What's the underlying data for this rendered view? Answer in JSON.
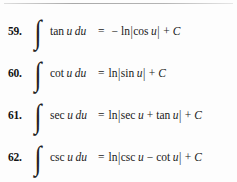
{
  "page": {
    "background_color": "#fdfdfd",
    "text_color": "#1a1a1a",
    "rule_color": "#9a9a9a"
  },
  "formulas": [
    {
      "number": "59.",
      "integral_symbol": "∫",
      "integrand_func": "tan",
      "integrand_var": "u",
      "differential": "du",
      "equals": "=",
      "rhs_sign": "−",
      "rhs_log": "ln",
      "abs_open": "|",
      "rhs_func": "cos",
      "rhs_var": "u",
      "abs_close": "|",
      "plus": "+",
      "constant": "C",
      "full_text": "59. ∫ tan u du = −ln|cos u| + C"
    },
    {
      "number": "60.",
      "integral_symbol": "∫",
      "integrand_func": "cot",
      "integrand_var": "u",
      "differential": "du",
      "equals": "=",
      "rhs_sign": "",
      "rhs_log": "ln",
      "abs_open": "|",
      "rhs_func": "sin",
      "rhs_var": "u",
      "abs_close": "|",
      "plus": "+",
      "constant": "C",
      "full_text": "60. ∫ cot u du = ln|sin u| + C"
    },
    {
      "number": "61.",
      "integral_symbol": "∫",
      "integrand_func": "sec",
      "integrand_var": "u",
      "differential": "du",
      "equals": "=",
      "rhs_sign": "",
      "rhs_log": "ln",
      "abs_open": "|",
      "rhs_func": "sec",
      "rhs_var": "u",
      "inner_op": "+",
      "rhs_func2": "tan",
      "rhs_var2": "u",
      "abs_close": "|",
      "plus": "+",
      "constant": "C",
      "full_text": "61. ∫ sec u du = ln|sec u + tan u| + C"
    },
    {
      "number": "62.",
      "integral_symbol": "∫",
      "integrand_func": "csc",
      "integrand_var": "u",
      "differential": "du",
      "equals": "=",
      "rhs_sign": "",
      "rhs_log": "ln",
      "abs_open": "|",
      "rhs_func": "csc",
      "rhs_var": "u",
      "inner_op": "−",
      "rhs_func2": "cot",
      "rhs_var2": "u",
      "abs_close": "|",
      "plus": "+",
      "constant": "C",
      "full_text": "62. ∫ csc u du = ln|csc u − cot u| + C"
    }
  ]
}
